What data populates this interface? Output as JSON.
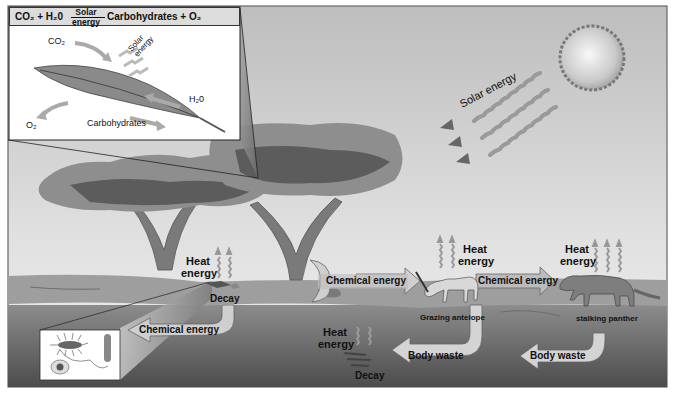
{
  "figure": {
    "colors": {
      "sky_top": "#c8c8c8",
      "sky_bottom": "#f2f2f2",
      "ground_surface": "#9a9a9a",
      "soil_top": "#8a8a8a",
      "soil_bottom": "#4a4a4a",
      "arrow_fill": "#cfcfcf",
      "arrow_dark": "#7a7a7a",
      "tree_light": "#8e8e8e",
      "tree_dark": "#5c5c5c",
      "frame": "#555555"
    }
  },
  "photosynthesis_inset": {
    "equation": {
      "left": "CO₂ + H₂0",
      "arrow_top": "Solar",
      "arrow_bottom": "energy",
      "right": "Carbohydrates + O₂"
    },
    "labels": {
      "co2": "CO₂",
      "solar_energy": "Solar energy",
      "h2o": "H₂0",
      "o2": "O₂",
      "carbohydrates": "Carbohydrates"
    }
  },
  "sun": {
    "label": "Solar energy"
  },
  "labels": {
    "heat_tree": "Heat energy",
    "decay_tree": "Decay",
    "chemical_energy_to_decomposers": "Chemical energy",
    "chemical_energy_tree_to_antelope": "Chemical energy",
    "heat_antelope": "Heat energy",
    "antelope": "Grazing antelope",
    "chemical_energy_antelope_to_panther": "Chemical energy",
    "heat_panther": "Heat energy",
    "panther": "stalking panther",
    "heat_decay": "Heat energy",
    "decay_middle": "Decay",
    "body_waste_antelope": "Body waste",
    "body_waste_panther": "Body waste"
  }
}
